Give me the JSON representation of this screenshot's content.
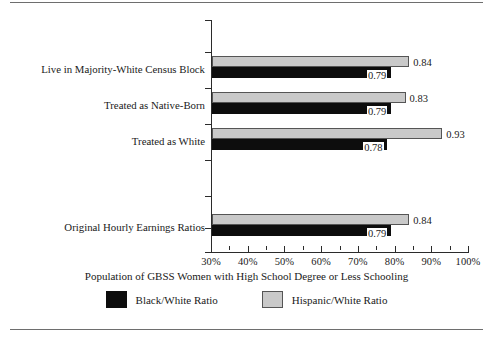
{
  "chart_data": {
    "type": "bar",
    "orientation": "horizontal",
    "title": "",
    "xlabel": "Population of GBSS Women with High School Degree or Less Schooling",
    "ylabel": "",
    "xlim": [
      30,
      100
    ],
    "xtick_labels": [
      "30%",
      "40%",
      "50%",
      "60%",
      "70%",
      "80%",
      "90%",
      "100%"
    ],
    "xtick_values": [
      30,
      40,
      50,
      60,
      70,
      80,
      90,
      100
    ],
    "minor_tick_step": 5,
    "grid": false,
    "legend_position": "bottom",
    "categories": [
      "Live in Majority-White Census Block",
      "Treated as Native-Born",
      "Treated as White",
      "Original Hourly Earnings Ratios"
    ],
    "series": [
      {
        "name": "Black/White Ratio",
        "color": "#0d0d0d",
        "values": [
          0.79,
          0.79,
          0.78,
          0.79
        ],
        "labels": [
          "0.79",
          "0.79",
          "0.78",
          "0.79"
        ]
      },
      {
        "name": "Hispanic/White Ratio",
        "color": "#c9c9c9",
        "values": [
          0.84,
          0.83,
          0.93,
          0.84
        ],
        "labels": [
          "0.84",
          "0.83",
          "0.93",
          "0.84"
        ]
      }
    ]
  },
  "axis": {
    "ticks": [
      {
        "label": "30%",
        "value": 30
      },
      {
        "label": "40%",
        "value": 40
      },
      {
        "label": "50%",
        "value": 50
      },
      {
        "label": "60%",
        "value": 60
      },
      {
        "label": "70%",
        "value": 70
      },
      {
        "label": "80%",
        "value": 80
      },
      {
        "label": "90%",
        "value": 90
      },
      {
        "label": "100%",
        "value": 100
      }
    ],
    "title": "Population of GBSS Women with High School Degree or Less Schooling"
  },
  "legend": {
    "items": [
      {
        "label": "Black/White Ratio",
        "swatch": "black"
      },
      {
        "label": "Hispanic/White Ratio",
        "swatch": "gray"
      }
    ]
  },
  "groups": [
    {
      "label": "Live in Majority-White Census Block",
      "gray_value": 0.84,
      "gray_label": "0.84",
      "black_value": 0.79,
      "black_label": "0.79"
    },
    {
      "label": "Treated as Native-Born",
      "gray_value": 0.83,
      "gray_label": "0.83",
      "black_value": 0.79,
      "black_label": "0.79"
    },
    {
      "label": "Treated as White",
      "gray_value": 0.93,
      "gray_label": "0.93",
      "black_value": 0.78,
      "black_label": "0.78"
    },
    {
      "label": "Original Hourly Earnings Ratios",
      "gray_value": 0.84,
      "gray_label": "0.84",
      "black_value": 0.79,
      "black_label": "0.79"
    }
  ]
}
